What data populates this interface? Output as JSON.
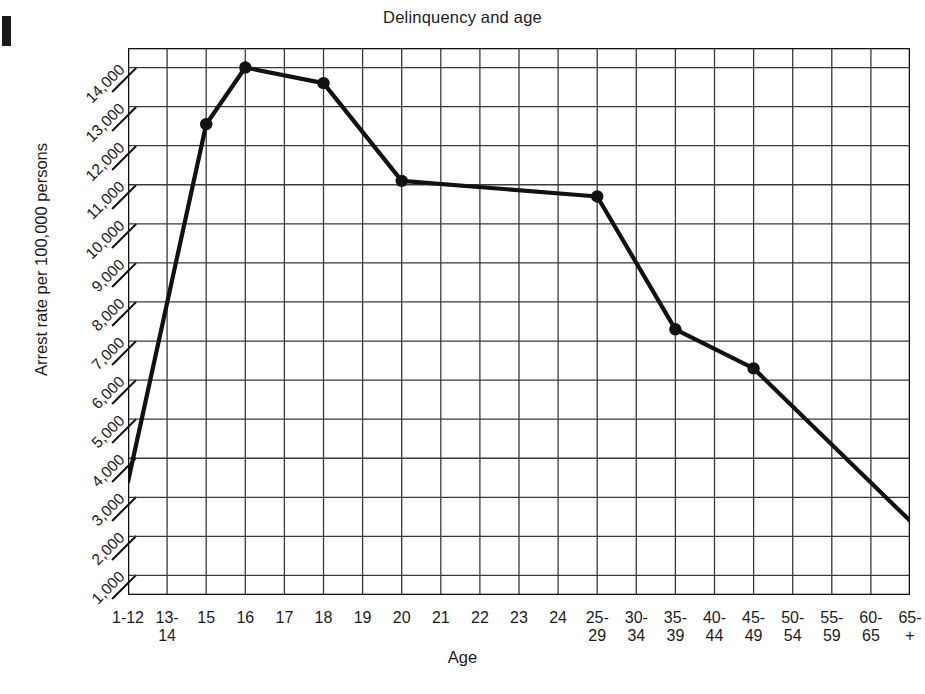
{
  "chart_data": {
    "type": "line",
    "title": "Delinquency and age",
    "xlabel": "Age",
    "ylabel": "Arrest rate per 100,000 persons",
    "grid": true,
    "legend": "none",
    "categories": [
      "1-12",
      "13-\n14",
      "15",
      "16",
      "17",
      "18",
      "19",
      "20",
      "21",
      "22",
      "23",
      "24",
      "25-\n29",
      "30-\n34",
      "35-\n39",
      "40-\n44",
      "45-\n49",
      "50-\n54",
      "55-\n59",
      "60-\n65",
      "65-\n+"
    ],
    "categories_flat": [
      "1-12",
      "13-14",
      "15",
      "16",
      "17",
      "18",
      "19",
      "20",
      "21",
      "22",
      "23",
      "24",
      "25-29",
      "30-34",
      "35-39",
      "40-44",
      "45-49",
      "50-54",
      "55-59",
      "60-65",
      "65+"
    ],
    "ytick_labels": [
      "1,000",
      "2,000",
      "3,000",
      "4,000",
      "5,000",
      "6,000",
      "7,000",
      "8,000",
      "9,000",
      "10,000",
      "11,000",
      "12,000",
      "13,000",
      "14,000"
    ],
    "ytick_values": [
      1000,
      2000,
      3000,
      4000,
      5000,
      6000,
      7000,
      8000,
      9000,
      10000,
      11000,
      12000,
      13000,
      14000
    ],
    "ylim": [
      500,
      14500
    ],
    "series": [
      {
        "name": "Arrest rate",
        "marker": "filled-circle",
        "color": "#111111",
        "points": [
          {
            "x": "1-12",
            "y": 3400,
            "marker": false
          },
          {
            "x": "15",
            "y": 12550,
            "marker": true
          },
          {
            "x": "16",
            "y": 14000,
            "marker": true
          },
          {
            "x": "18",
            "y": 13600,
            "marker": true
          },
          {
            "x": "20",
            "y": 11100,
            "marker": true
          },
          {
            "x": "25-29",
            "y": 10700,
            "marker": true
          },
          {
            "x": "35-39",
            "y": 7300,
            "marker": true
          },
          {
            "x": "45-49",
            "y": 6300,
            "marker": true
          },
          {
            "x": "65+",
            "y": 2400,
            "marker": false
          }
        ]
      }
    ],
    "colors": {
      "line": "#111111",
      "grid": "#3a3a3a",
      "axis": "#111111",
      "background": "#ffffff"
    }
  }
}
